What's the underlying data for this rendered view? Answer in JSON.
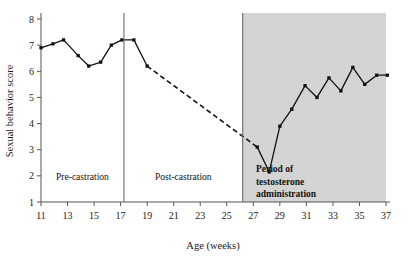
{
  "chart_data": {
    "type": "line",
    "title": "",
    "xlabel": "Age (weeks)",
    "ylabel": "Sexual behavior score",
    "xlim": [
      11,
      37
    ],
    "ylim": [
      1,
      8
    ],
    "xticks": [
      11,
      13,
      15,
      17,
      19,
      21,
      23,
      25,
      27,
      29,
      31,
      33,
      35,
      37
    ],
    "yticks": [
      1,
      2,
      3,
      4,
      5,
      6,
      7,
      8
    ],
    "grid": false,
    "legend": "none",
    "series": [
      {
        "name": "Pre-castration sexual behavior score",
        "style": "solid",
        "marker": "filled-square",
        "points": [
          {
            "x": 11.0,
            "y": 6.9
          },
          {
            "x": 11.9,
            "y": 7.05
          },
          {
            "x": 12.7,
            "y": 7.2
          },
          {
            "x": 13.8,
            "y": 6.6
          },
          {
            "x": 14.6,
            "y": 6.2
          },
          {
            "x": 15.5,
            "y": 6.35
          },
          {
            "x": 16.3,
            "y": 7.0
          },
          {
            "x": 17.1,
            "y": 7.2
          },
          {
            "x": 18.0,
            "y": 7.2
          },
          {
            "x": 19.0,
            "y": 6.2
          }
        ]
      },
      {
        "name": "Post-castration decline (interpolated)",
        "style": "dashed",
        "marker": "none",
        "points": [
          {
            "x": 19.0,
            "y": 6.2
          },
          {
            "x": 27.3,
            "y": 3.1
          }
        ]
      },
      {
        "name": "Post-castration and testosterone administration score",
        "style": "solid",
        "marker": "filled-square",
        "points": [
          {
            "x": 27.3,
            "y": 3.1
          },
          {
            "x": 28.2,
            "y": 2.15
          },
          {
            "x": 29.0,
            "y": 3.9
          },
          {
            "x": 29.9,
            "y": 4.55
          },
          {
            "x": 30.9,
            "y": 5.45
          },
          {
            "x": 31.8,
            "y": 5.0
          },
          {
            "x": 32.7,
            "y": 5.75
          },
          {
            "x": 33.6,
            "y": 5.25
          },
          {
            "x": 34.5,
            "y": 6.15
          },
          {
            "x": 35.4,
            "y": 5.5
          },
          {
            "x": 36.3,
            "y": 5.85
          },
          {
            "x": 37.1,
            "y": 5.85
          }
        ]
      }
    ],
    "regions": [
      {
        "name": "pre-castration",
        "label": "Pre-castration",
        "label_lines": [
          "Pre-castration"
        ],
        "x_start": 11,
        "x_end": 17.25,
        "shaded": false,
        "bold": false,
        "fill": "#ffffff"
      },
      {
        "name": "post-castration",
        "label": "Post-castration",
        "label_lines": [
          "Post-castration"
        ],
        "x_start": 17.25,
        "x_end": 26.2,
        "shaded": false,
        "bold": false,
        "fill": "#ffffff"
      },
      {
        "name": "testosterone-administration",
        "label": "Period of testosterone administration",
        "label_lines": [
          "Period of",
          "testosterone",
          "administration"
        ],
        "x_start": 26.2,
        "x_end": 37,
        "shaded": true,
        "bold": true,
        "fill": "#d4d4d4"
      }
    ],
    "dividers": [
      17.25,
      26.2
    ],
    "colors": {
      "line": "#111111",
      "marker": "#111111",
      "axis": "#555555",
      "shaded_region": "#d4d4d4",
      "background": "#ffffff",
      "text": "#1a1a1a"
    }
  }
}
